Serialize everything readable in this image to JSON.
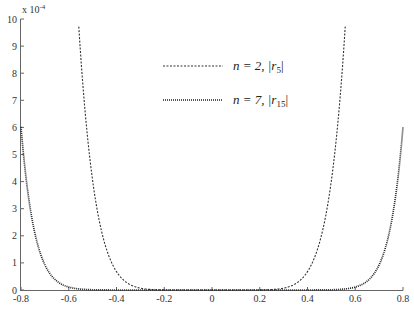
{
  "chart_data": {
    "type": "line",
    "title": "",
    "xlabel": "",
    "ylabel": "",
    "y_multiplier_label": "x 10",
    "y_multiplier_exponent": "-4",
    "xlim": [
      -0.8,
      0.8
    ],
    "ylim": [
      0,
      10
    ],
    "x_ticks": [
      "-0.8",
      "-0.6",
      "-0.4",
      "-0.2",
      "0",
      "0.2",
      "0.4",
      "0.6",
      "0.8"
    ],
    "y_ticks": [
      "0",
      "1",
      "2",
      "3",
      "4",
      "5",
      "6",
      "7",
      "8",
      "9",
      "10"
    ],
    "grid": false,
    "legend_position": "upper center",
    "series": [
      {
        "name": "n = 2, |r5|",
        "legend_main": "n = 2, |r",
        "legend_sub": "5",
        "legend_close": "|",
        "style": "dashed",
        "color": "#333333",
        "model": {
          "coef": 1034,
          "power": 8
        },
        "x": [
          -0.56,
          -0.54,
          -0.52,
          -0.5,
          -0.48,
          -0.46,
          -0.44,
          -0.42,
          -0.4,
          -0.36,
          -0.32,
          -0.28,
          -0.24,
          -0.2,
          0,
          0.2,
          0.24,
          0.28,
          0.32,
          0.36,
          0.4,
          0.42,
          0.44,
          0.46,
          0.48,
          0.5,
          0.52,
          0.54,
          0.56
        ],
        "values": [
          9.9,
          7.4,
          5.5,
          4.0,
          2.9,
          2.1,
          1.4,
          1.0,
          0.66,
          0.29,
          0.12,
          0.04,
          0.01,
          0.0,
          0.0,
          0.0,
          0.01,
          0.04,
          0.12,
          0.29,
          0.66,
          1.0,
          1.4,
          2.1,
          2.9,
          4.0,
          5.5,
          7.4,
          9.9
        ]
      },
      {
        "name": "n = 7, |r15|",
        "legend_main": "n = 7, |r",
        "legend_sub": "15",
        "legend_close": "|",
        "style": "dotted",
        "color": "#222222",
        "model": {
          "coef": 136.9,
          "power": 14
        },
        "x": [
          -0.8,
          -0.78,
          -0.76,
          -0.74,
          -0.72,
          -0.7,
          -0.68,
          -0.66,
          -0.64,
          -0.62,
          -0.6,
          -0.55,
          -0.5,
          0,
          0.5,
          0.55,
          0.6,
          0.62,
          0.64,
          0.66,
          0.68,
          0.7,
          0.72,
          0.74,
          0.76,
          0.78,
          0.8
        ],
        "values": [
          6.0,
          4.2,
          2.9,
          2.0,
          1.4,
          0.92,
          0.62,
          0.41,
          0.26,
          0.17,
          0.11,
          0.03,
          0.01,
          0.0,
          0.01,
          0.03,
          0.11,
          0.17,
          0.26,
          0.41,
          0.62,
          0.92,
          1.4,
          2.0,
          2.9,
          4.2,
          6.0
        ]
      }
    ]
  },
  "caption": {
    "visible": "partial (cut off at bottom edge)"
  }
}
